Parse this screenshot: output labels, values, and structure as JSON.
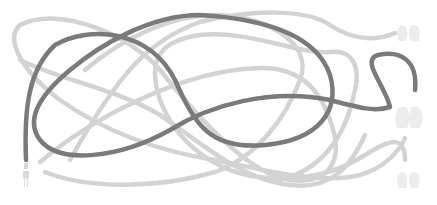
{
  "puzzle": {
    "type": "tangled-lines",
    "start": {
      "name": "plug",
      "x": 26,
      "y": 160
    },
    "colors": {
      "highlighted_line": "#7a7a7a",
      "other_lines": "#d3d3d3",
      "end_icons": "#ececec",
      "background": "#ffffff"
    },
    "ends": [
      {
        "id": "end-top",
        "icon": "mitten-pair-icon",
        "x": 410,
        "y": 33
      },
      {
        "id": "end-middle",
        "icon": "mitten-pair-icon",
        "x": 410,
        "y": 117
      },
      {
        "id": "end-bottom",
        "icon": "mitten-pair-icon",
        "x": 410,
        "y": 180
      }
    ],
    "lines": [
      {
        "id": "highlighted",
        "style": "dark",
        "d": "M26,160 C24,110 28,70 55,45 C90,25 150,30 175,80 C195,125 210,150 265,145 C320,140 340,110 330,75 C315,30 250,18 200,15 C150,15 100,45 70,70 C40,95 25,120 40,140 C60,165 120,158 170,130 C210,105 270,88 330,100 C360,108 375,112 390,107 C385,85 360,60 378,55 C400,50 418,60 415,90"
      },
      {
        "id": "light-1",
        "style": "light",
        "d": "M45,172 C90,190 160,188 215,172 C255,158 285,120 300,80 C315,40 260,15 215,15 C170,15 120,40 85,70"
      },
      {
        "id": "light-2",
        "style": "light",
        "d": "M395,33 C380,40 355,42 330,25 C305,8 250,10 200,22 C150,40 120,70 70,160"
      },
      {
        "id": "light-3",
        "style": "light",
        "d": "M40,162 C90,120 180,70 260,68 C300,67 320,90 330,120 C345,160 330,185 290,180 C250,175 200,120 160,70 C130,35 60,5 20,25 C5,38 20,70 60,100 C100,128 150,150 215,160 C265,170 320,185 360,175 C385,168 400,150 405,138"
      },
      {
        "id": "light-4",
        "style": "light",
        "d": "M405,160 C405,135 390,140 370,152 C345,168 320,180 270,178 C215,176 175,140 160,100 C145,55 165,40 200,35 C250,30 300,55 330,52 C355,49 360,70 355,90 C345,140 320,170 280,180"
      },
      {
        "id": "light-5",
        "style": "light",
        "d": "M20,60 C60,80 120,90 160,115 C195,138 240,180 290,185 C330,190 350,168 365,135"
      }
    ]
  }
}
